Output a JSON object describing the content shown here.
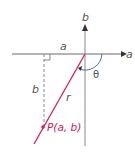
{
  "diagram": {
    "title": "",
    "labels": {
      "vertical_axis": "b",
      "horizontal_axis": "a",
      "horizontal_segment": "a",
      "vertical_segment": "b",
      "radius": "r",
      "angle": "θ",
      "point": "P(a, b)"
    },
    "colors": {
      "axes": "#6b6b6b",
      "radius_line": "#d61f5f",
      "dashed": "#8a8a8a",
      "arc": "#3d5fa8",
      "point_label": "#c8185a"
    }
  }
}
